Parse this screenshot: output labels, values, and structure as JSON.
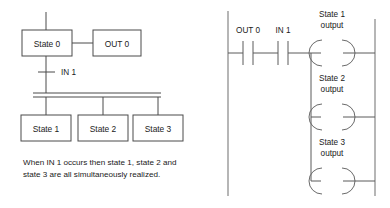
{
  "figure": {
    "left_diagram": {
      "name": "sequential-function-chart",
      "state0": {
        "label": "State 0"
      },
      "out0": {
        "label": "OUT 0"
      },
      "transition": {
        "label": "IN 1"
      },
      "branch_states": [
        {
          "label": "State 1"
        },
        {
          "label": "State 2"
        },
        {
          "label": "State 3"
        }
      ],
      "caption": {
        "line1": "When IN 1 occurs then state 1, state 2 and",
        "line2": "state 3 are all simultaneously realized."
      }
    },
    "right_diagram": {
      "name": "ladder-logic-rung",
      "contacts": [
        {
          "label": "OUT 0"
        },
        {
          "label": "IN 1"
        }
      ],
      "coils": [
        {
          "line1": "State 1",
          "line2": "output"
        },
        {
          "line1": "State 2",
          "line2": "output"
        },
        {
          "line1": "State 3",
          "line2": "output"
        }
      ]
    },
    "colors": {
      "line": "#4a4a4a",
      "rail": "#7a7a7a",
      "text": "#1a1a1a",
      "background": "#ffffff"
    }
  }
}
